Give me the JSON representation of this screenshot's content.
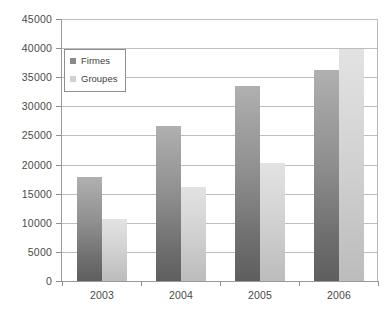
{
  "chart_data": {
    "type": "bar",
    "title": "",
    "subtitle": "",
    "xlabel": "",
    "ylabel": "",
    "categories": [
      "2003",
      "2004",
      "2005",
      "2006"
    ],
    "series": [
      {
        "name": "Firmes",
        "color": "#8a8a8a",
        "values": [
          17800,
          26600,
          33500,
          36200
        ]
      },
      {
        "name": "Groupes",
        "color": "#d2d2d2",
        "values": [
          10700,
          16200,
          20200,
          39800
        ]
      }
    ],
    "ylim": [
      0,
      45000
    ],
    "ytick_step": 5000,
    "yticks": [
      0,
      5000,
      10000,
      15000,
      20000,
      25000,
      30000,
      35000,
      40000,
      45000
    ],
    "ytick_labels": [
      "0",
      "5000",
      "10000",
      "15000",
      "20000",
      "25000",
      "30000",
      "35000",
      "40000",
      "45000"
    ],
    "xtick_labels": [
      "2003",
      "2004",
      "2005",
      "2006"
    ],
    "grid": true,
    "grid_axis": "y",
    "legend": {
      "position": "upper-left-inside",
      "entries": [
        {
          "label": "Firmes",
          "swatch": "legend-swatch-firmes"
        },
        {
          "label": "Groupes",
          "swatch": "legend-swatch-groupes"
        }
      ]
    }
  }
}
